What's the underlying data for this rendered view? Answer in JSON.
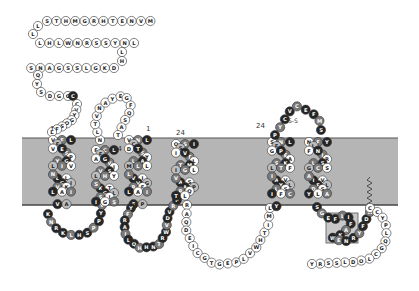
{
  "colors": {
    "membrane": "#b5b5b5",
    "membrane_edge": "#555555",
    "white": "#ffffff",
    "light": "#bdbdbd",
    "mid": "#7a7a7a",
    "dark": "#262626",
    "outline": "#333333"
  },
  "legend_marks": {
    "tm_start": "1",
    "tm_end": "24",
    "disulfide": "S-S"
  },
  "n_terminus": {
    "row1": "STHMGRHTENVM",
    "row2": "LHLWNRSSYNL",
    "connector": "LH",
    "row3": "DKGLSSGANS",
    "row4": "QYSDGGC"
  },
  "segments": [
    {
      "name": "extracellular-loop-1",
      "seq": "CVYGOSFL",
      "shade": "w"
    },
    {
      "name": "tm1",
      "seq": "VFLFSVEPYGLIVLLNGIVKLAIVA",
      "shade": "m"
    },
    {
      "name": "intracellular-loop-1",
      "seq": "KNRKLHSPPYV",
      "shade": "d"
    },
    {
      "name": "tm2",
      "seq": "FCLFVAGIVSLHYKTSGLSIIGS",
      "shade": "m"
    },
    {
      "name": "extracellular-loop-2",
      "seq": "NLTVNAYEGFQSAT",
      "shade": "w"
    },
    {
      "name": "tm3",
      "seq": "VNLCSDTYLAMLLVILVGRFLAIFP",
      "shade": "m"
    },
    {
      "name": "intracellular-loop-2",
      "seq": "YFRAILQHHNTRWVDVRF",
      "shade": "d"
    },
    {
      "name": "tm4",
      "seq": "OSISTIVLTMIGLASVAPRQTL",
      "shade": "m"
    },
    {
      "name": "intracellular-loop-3",
      "seq": "RAQDEICGTGEPLVWHTIML",
      "shade": "w"
    },
    {
      "name": "tm5",
      "seq": "SNLFEGPASKLTFAVIYLLSIFCY",
      "shade": "m"
    },
    {
      "name": "extracellular-loop-3",
      "seq": "PYCVCEFMS",
      "shade": "d"
    },
    {
      "name": "tm6",
      "seq": "NFYLIFNRLSGCSIVAFLDSYLA",
      "shade": "m"
    },
    {
      "name": "helix-8",
      "seq": "SGEFLIFAKWENRYFDW",
      "shade": "d"
    },
    {
      "name": "c-terminus",
      "seq": "CCYPLQGCLODLSSRY",
      "shade": "w"
    }
  ]
}
